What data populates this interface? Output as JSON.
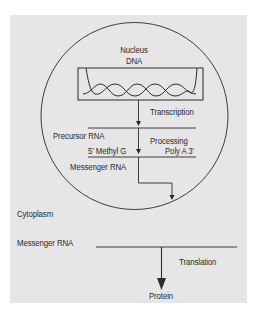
{
  "diagram": {
    "colors": {
      "background": "#e6e6e8",
      "stroke": "#2a2a2a",
      "text": "#2a2a2a"
    },
    "nucleus": {
      "label": "Nucleus",
      "dna_label": "DNA",
      "steps": {
        "transcription": "Transcription",
        "precursor_rna": "Precursor RNA",
        "processing": "Processing",
        "five_prime_cap": "5' Methyl G",
        "poly_a_tail": "Poly A 3'",
        "messenger_rna": "Messenger RNA"
      }
    },
    "cytoplasm": {
      "label": "Cytoplasm",
      "messenger_rna": "Messenger RNA",
      "translation": "Translation",
      "product": "Protein"
    }
  }
}
